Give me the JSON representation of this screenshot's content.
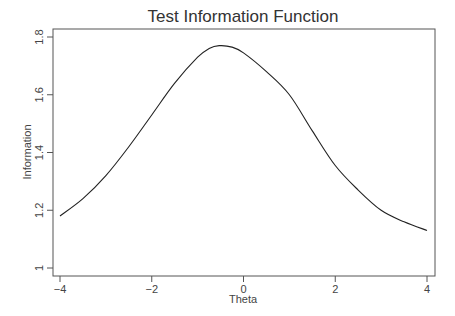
{
  "chart_data": {
    "type": "line",
    "title": "Test Information Function",
    "xlabel": "Theta",
    "ylabel": "Information",
    "xlim": [
      -4,
      4
    ],
    "ylim": [
      1.0,
      1.8
    ],
    "xticks": [
      -4,
      -2,
      0,
      2,
      4
    ],
    "xtick_labels": [
      "−4",
      "−2",
      "0",
      "2",
      "4"
    ],
    "yticks": [
      1.0,
      1.2,
      1.4,
      1.6,
      1.8
    ],
    "ytick_labels": [
      "1",
      "1.2",
      "1.4",
      "1.6",
      "1.8"
    ],
    "grid": false,
    "legend": null,
    "series": [
      {
        "name": "Test Information",
        "x": [
          -4,
          -3.5,
          -3,
          -2.5,
          -2,
          -1.5,
          -1,
          -0.75,
          -0.53,
          -0.25,
          0,
          0.5,
          1,
          1.5,
          2,
          2.5,
          3,
          3.5,
          4
        ],
        "values": [
          1.18,
          1.24,
          1.32,
          1.42,
          1.53,
          1.64,
          1.73,
          1.76,
          1.77,
          1.765,
          1.745,
          1.68,
          1.6,
          1.475,
          1.355,
          1.27,
          1.2,
          1.16,
          1.13
        ]
      }
    ]
  }
}
